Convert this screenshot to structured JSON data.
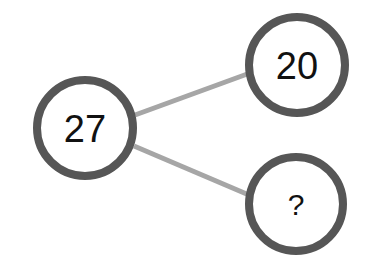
{
  "diagram": {
    "colors": {
      "ring": "#565656",
      "edge": "#a6a6a6",
      "fill": "#ffffff",
      "text": "#111111"
    },
    "nodes": [
      {
        "id": "root",
        "label": "27",
        "cx": 85,
        "cy": 128,
        "r": 48,
        "font_size": 38
      },
      {
        "id": "top",
        "label": "20",
        "cx": 297,
        "cy": 65,
        "r": 48,
        "font_size": 38
      },
      {
        "id": "bottom",
        "label": "?",
        "cx": 296,
        "cy": 204,
        "r": 47,
        "font_size": 30
      }
    ],
    "edges": [
      {
        "from": "root",
        "to": "top"
      },
      {
        "from": "root",
        "to": "bottom"
      }
    ]
  }
}
